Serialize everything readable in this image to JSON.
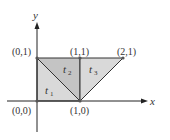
{
  "diagram": {
    "axes": {
      "x_label": "x",
      "y_label": "y"
    },
    "points": [
      {
        "id": "p00",
        "label": "(0,0)"
      },
      {
        "id": "p01",
        "label": "(0,1)"
      },
      {
        "id": "p11",
        "label": "(1,1)"
      },
      {
        "id": "p21",
        "label": "(2,1)"
      },
      {
        "id": "p10",
        "label": "(1,0)"
      }
    ],
    "triangles": [
      {
        "id": "t1",
        "name": "t",
        "sub": "1",
        "vertices": [
          "(0,0)",
          "(0,1)",
          "(1,0)"
        ],
        "fill": "#d9d9d9"
      },
      {
        "id": "t2",
        "name": "t",
        "sub": "2",
        "vertices": [
          "(0,1)",
          "(1,1)",
          "(1,0)"
        ],
        "fill": "#c4c4c4"
      },
      {
        "id": "t3",
        "name": "t",
        "sub": "3",
        "vertices": [
          "(1,1)",
          "(2,1)",
          "(1,0)"
        ],
        "fill": "#d9d9d9"
      }
    ],
    "colors": {
      "stroke": "#333333",
      "axis": "#222222"
    }
  }
}
